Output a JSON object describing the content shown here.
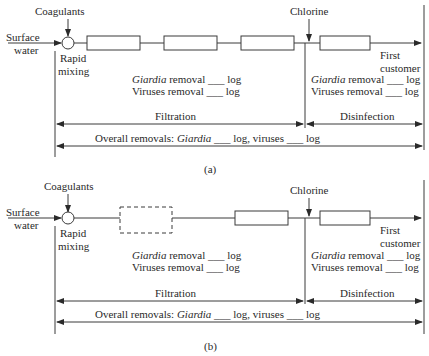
{
  "diagrams": [
    {
      "id": "a",
      "caption": "(a)",
      "inputs": {
        "coagulants": "Coagulants",
        "source_line1": "Surface",
        "source_line2": "water",
        "chlorine": "Chlorine"
      },
      "mixing": {
        "line1": "Rapid",
        "line2": "mixing"
      },
      "output": {
        "line1": "First",
        "line2": "customer"
      },
      "filtration_box": {
        "giardia_label": "Giardia",
        "giardia_rest": " removal ___ log",
        "viruses": "Viruses removal ___ log"
      },
      "disinfection_box": {
        "giardia_label": "Giardia",
        "giardia_rest": " removal ___ log",
        "viruses": "Viruses removal ___ log"
      },
      "stages": {
        "filtration": "Filtration",
        "disinfection": "Disinfection"
      },
      "overall": {
        "prefix": "Overall removals: ",
        "giardia": "Giardia",
        "suffix": " ___ log, viruses ___ log"
      },
      "units": [
        "solid",
        "solid",
        "solid"
      ]
    },
    {
      "id": "b",
      "caption": "(b)",
      "inputs": {
        "coagulants": "Coagulants",
        "source_line1": "Surface",
        "source_line2": "water",
        "chlorine": "Chlorine"
      },
      "mixing": {
        "line1": "Rapid",
        "line2": "mixing"
      },
      "output": {
        "line1": "First",
        "line2": "customer"
      },
      "filtration_box": {
        "giardia_label": "Giardia",
        "giardia_rest": " removal ___ log",
        "viruses": "Viruses removal ___ log"
      },
      "disinfection_box": {
        "giardia_label": "Giardia",
        "giardia_rest": " removal ___ log",
        "viruses": "Viruses removal ___ log"
      },
      "stages": {
        "filtration": "Filtration",
        "disinfection": "Disinfection"
      },
      "overall": {
        "prefix": "Overall removals: ",
        "giardia": "Giardia",
        "suffix": " ___ log, viruses ___ log"
      },
      "units": [
        "dashed",
        "solid"
      ]
    }
  ]
}
